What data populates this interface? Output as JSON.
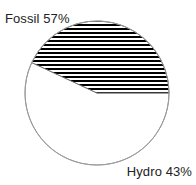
{
  "chart_data": {
    "type": "pie",
    "title": "",
    "categories": [
      "Fossil",
      "Hydro"
    ],
    "values": [
      57,
      43
    ],
    "unit": "%",
    "labels": [
      "Fossil 57%",
      "Hydro 43%"
    ],
    "legend": "none",
    "grid": false,
    "slices": [
      {
        "name": "Fossil",
        "value": 57,
        "label": "Fossil 57%",
        "fill": "#ffffff",
        "pattern": "none",
        "start_angle_deg": 155,
        "sweep_deg": 205
      },
      {
        "name": "Hydro",
        "value": 43,
        "label": "Hydro 43%",
        "fill": "#ffffff",
        "pattern": "horizontal-hatch",
        "pattern_color": "#000000",
        "start_angle_deg": 0,
        "sweep_deg": 155
      }
    ],
    "geometry": {
      "center_x": 97,
      "center_y": 93,
      "radius": 72
    },
    "style": {
      "outline_color": "#9a9a9a",
      "outline_width": 1,
      "hatch_color": "#000000",
      "hatch_period": 4,
      "hatch_thickness": 2,
      "background": "#ffffff",
      "label_color": "#222222"
    }
  },
  "labels": {
    "fossil": "Fossil 57%",
    "hydro": "Hydro 43%"
  }
}
